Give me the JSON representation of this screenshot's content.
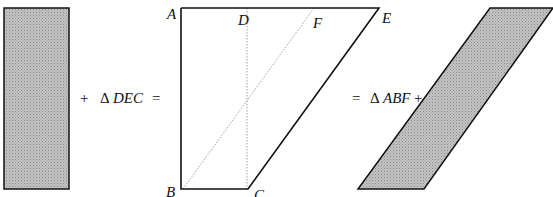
{
  "figure": {
    "type": "geometric-area-equivalence",
    "colors": {
      "stroke": "#111111",
      "shade": "#b8b8b8",
      "dotted": "#888888",
      "background": "#ffffff"
    },
    "equation": {
      "term1": "shaded rectangle",
      "plus1": "+",
      "delta1": "Δ",
      "tri1": "DEC",
      "eq1": "=",
      "eq2": "=",
      "delta2": "Δ",
      "tri2": "ABF",
      "plus2": "+",
      "term_last": "shaded parallelogram"
    },
    "vertices": {
      "A": "A",
      "B": "B",
      "C": "C",
      "D": "D",
      "E": "E",
      "F": "F"
    }
  }
}
